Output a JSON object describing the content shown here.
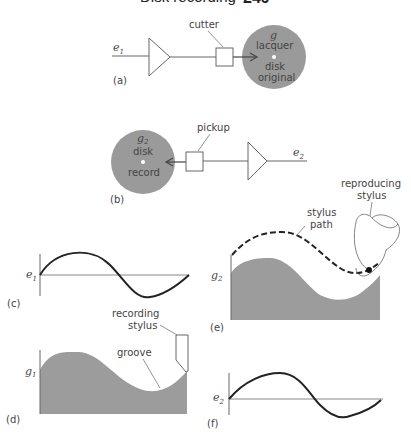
{
  "header": {
    "title": "Disk recording",
    "page_number": "249"
  },
  "colors": {
    "disk_fill": "#9a9a9a",
    "groove_fill": "#9c9c9c",
    "line": "#555555",
    "curve": "#222222"
  },
  "panels": {
    "a": {
      "tag": "(a)",
      "input_label": "e",
      "input_sub": "1",
      "cutter_label": "cutter",
      "disk_symbol": "g",
      "disk_lines": [
        "lacquer",
        "disk",
        "original"
      ]
    },
    "b": {
      "tag": "(b)",
      "output_label": "e",
      "output_sub": "2",
      "pickup_label": "pickup",
      "disk_symbol": "g",
      "disk_sub": "2",
      "disk_lines": [
        "disk",
        "record"
      ]
    },
    "c": {
      "tag": "(c)",
      "axis_label": "e",
      "axis_sub": "1"
    },
    "d": {
      "tag": "(d)",
      "axis_label": "g",
      "axis_sub": "1",
      "stylus_label_line1": "recording",
      "stylus_label_line2": "stylus",
      "groove_label": "groove"
    },
    "e": {
      "tag": "(e)",
      "axis_label": "g",
      "axis_sub": "2",
      "path_label_line1": "stylus",
      "path_label_line2": "path",
      "stylus_label_line1": "reproducing",
      "stylus_label_line2": "stylus"
    },
    "f": {
      "tag": "(f)",
      "axis_label": "e",
      "axis_sub": "2"
    }
  }
}
